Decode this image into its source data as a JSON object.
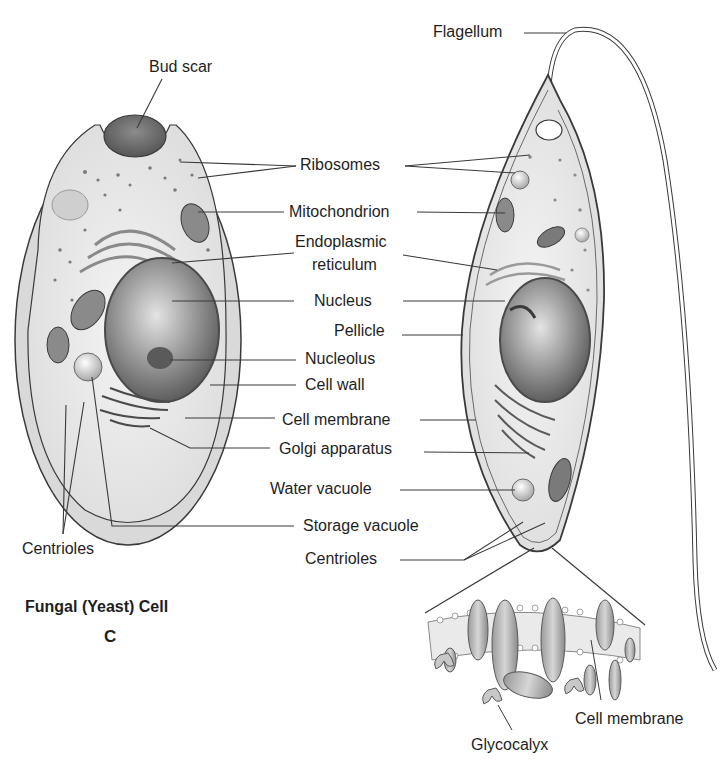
{
  "figure": {
    "title": "Fungal (Yeast) Cell",
    "panel_letter": "C"
  },
  "colors": {
    "line": "#3a3a3a",
    "cell_wall": "#d8d8d8",
    "cytoplasm": "#efefef",
    "organelle_dark": "#6e6e6e",
    "nucleus": "#8a8a8a",
    "background": "#ffffff"
  },
  "labels": {
    "bud_scar": "Bud scar",
    "flagellum": "Flagellum",
    "ribosomes": "Ribosomes",
    "mitochondrion": "Mitochondrion",
    "er_line1": "Endoplasmic",
    "er_line2": "reticulum",
    "nucleus": "Nucleus",
    "pellicle": "Pellicle",
    "nucleolus": "Nucleolus",
    "cell_wall": "Cell wall",
    "cell_membrane": "Cell membrane",
    "golgi": "Golgi apparatus",
    "water_vacuole": "Water vacuole",
    "storage_vacuole": "Storage vacuole",
    "centrioles_center": "Centrioles",
    "centrioles_left": "Centrioles",
    "glycocalyx": "Glycocalyx",
    "cell_membrane_inset": "Cell membrane"
  }
}
